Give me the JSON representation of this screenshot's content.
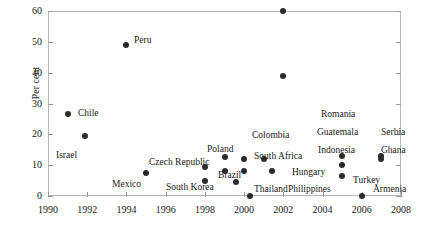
{
  "chart_data": {
    "type": "scatter",
    "title": "",
    "xlabel": "",
    "ylabel": "Per cent",
    "xlim": [
      1990,
      2008
    ],
    "ylim": [
      0,
      60
    ],
    "xticks": [
      1990,
      1992,
      1994,
      1996,
      1998,
      2000,
      2002,
      2004,
      2006,
      2008
    ],
    "yticks": [
      0,
      10,
      20,
      30,
      40,
      50,
      60
    ],
    "grid": false,
    "legend": "none",
    "marker_color": "#2b2b2b",
    "points": [
      {
        "name": "Chile",
        "x": 1991,
        "y": 26.5,
        "lx": 78,
        "ly": 108
      },
      {
        "name": "Israel",
        "x": 1991.9,
        "y": 19.5,
        "lx": 56,
        "ly": 150
      },
      {
        "name": "Peru",
        "x": 1994,
        "y": 49.0,
        "lx": 134,
        "ly": 35
      },
      {
        "name": "Mexico",
        "x": 1995,
        "y": 7.5,
        "lx": 112,
        "ly": 179
      },
      {
        "name": "Czech Republic",
        "x": 1998,
        "y": 9.5,
        "lx": 149,
        "ly": 157
      },
      {
        "name": "South Korea",
        "x": 1998,
        "y": 5.0,
        "lx": 166,
        "ly": 182
      },
      {
        "name": "Brazil",
        "x": 1999,
        "y": 8.0,
        "lx": 218,
        "ly": 170
      },
      {
        "name": "Poland",
        "x": 1999,
        "y": 12.5,
        "lx": 207,
        "ly": 144
      },
      {
        "name": "Thailand",
        "x": 1999,
        "y": 4.5,
        "lx": 254,
        "ly": 184
      },
      {
        "name": "Colombia",
        "x": 2000,
        "y": 12.0,
        "lx": 252,
        "ly": 130
      },
      {
        "name": "South Africa",
        "x": 2000,
        "y": 8.0,
        "lx": 254,
        "ly": 151
      },
      {
        "name": "Hungary",
        "x": 2000,
        "y": 2.0,
        "lx": 292,
        "ly": 167
      },
      {
        "name": "Philippines",
        "x": 2001,
        "y": 11.0,
        "lx": 288,
        "ly": 184
      },
      {
        "name": "Romania",
        "x": 2002,
        "y": 39.0,
        "lx": 321,
        "ly": 109
      },
      {
        "name": "Guatemala",
        "x": 2002,
        "y": 60.0,
        "lx": 317,
        "ly": 127
      },
      {
        "name": "Indonesia",
        "x": 2001,
        "y": 7.5,
        "lx": 318,
        "ly": 145
      },
      {
        "name": "Turkey",
        "x": 2005,
        "y": 13.0,
        "lx": 353,
        "ly": 175
      },
      {
        "name": "Serbia",
        "x": 2005,
        "y": 10.0,
        "lx": 381,
        "ly": 127
      },
      {
        "name": "Ghana",
        "x": 2005,
        "y": 6.5,
        "lx": 381,
        "ly": 145
      },
      {
        "name": "Armenia",
        "x": 2006,
        "y": 2.0,
        "lx": 373,
        "ly": 184
      }
    ],
    "markers": [
      {
        "x": 1991,
        "y": 26.5
      },
      {
        "x": 1991.9,
        "y": 19.5
      },
      {
        "x": 1994,
        "y": 49.0
      },
      {
        "x": 1995,
        "y": 7.5
      },
      {
        "x": 1998,
        "y": 9.5
      },
      {
        "x": 1998,
        "y": 5.0
      },
      {
        "x": 1999,
        "y": 12.5
      },
      {
        "x": 1999,
        "y": 8.0
      },
      {
        "x": 1999.6,
        "y": 4.5
      },
      {
        "x": 2000,
        "y": 12.0
      },
      {
        "x": 2000,
        "y": 8.0
      },
      {
        "x": 2000.3,
        "y": 0.0
      },
      {
        "x": 2001,
        "y": 12.0
      },
      {
        "x": 2001.4,
        "y": 8.0
      },
      {
        "x": 2002,
        "y": 60.0
      },
      {
        "x": 2002,
        "y": 39.0
      },
      {
        "x": 2005,
        "y": 13.0
      },
      {
        "x": 2005,
        "y": 10.0
      },
      {
        "x": 2005,
        "y": 6.5
      },
      {
        "x": 2006,
        "y": 0.0
      },
      {
        "x": 2007,
        "y": 13.0
      },
      {
        "x": 2007,
        "y": 12.0
      }
    ]
  }
}
